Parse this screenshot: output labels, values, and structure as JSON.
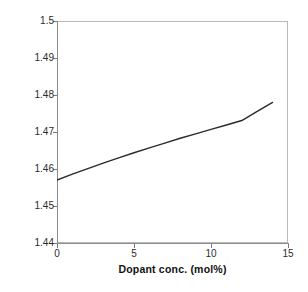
{
  "chart_data": {
    "type": "line",
    "title": "",
    "xlabel": "Dopant conc. (mol%)",
    "ylabel": "Refractive index",
    "xlim": [
      0,
      15
    ],
    "ylim": [
      1.44,
      1.5
    ],
    "xticks": [
      "0",
      "5",
      "10",
      "15"
    ],
    "xtick_values": [
      0,
      5,
      10,
      15
    ],
    "yticks": [
      "1.44",
      "1.45",
      "1.46",
      "1.47",
      "1.48",
      "1.49",
      "1.5"
    ],
    "ytick_values": [
      1.44,
      1.45,
      1.46,
      1.47,
      1.48,
      1.49,
      1.5
    ],
    "grid": false,
    "legend": null,
    "series": [
      {
        "name": "Refractive index vs dopant concentration",
        "color": "#2a2a2a",
        "x": [
          0,
          1,
          2,
          3,
          4,
          5,
          6,
          7,
          8,
          9,
          10,
          11,
          12,
          13,
          14
        ],
        "y": [
          1.457,
          1.4586,
          1.4601,
          1.4616,
          1.463,
          1.4644,
          1.4657,
          1.467,
          1.4683,
          1.4695,
          1.4707,
          1.4719,
          1.4731,
          1.4756,
          1.478
        ]
      }
    ]
  },
  "figure": {
    "background_color": "#ffffff",
    "frame_color": "#b9b9b9",
    "axis_color": "#8c8c8c",
    "line_color": "#2a2a2a"
  }
}
